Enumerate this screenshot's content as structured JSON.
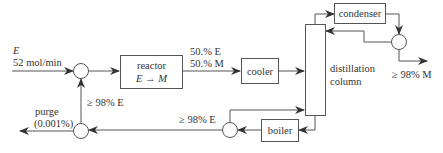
{
  "diagram": {
    "feed": {
      "species": "E",
      "rate": "52 mol/min"
    },
    "reactor": {
      "label": "reactor",
      "reaction": "E → M"
    },
    "reactor_outlet": {
      "line1": "50.% E",
      "line2": "50.% M"
    },
    "cooler": {
      "label": "cooler"
    },
    "column": {
      "line1": "distillation",
      "line2": "column"
    },
    "condenser": {
      "label": "condenser"
    },
    "product": {
      "label": "≥ 98% M"
    },
    "boiler": {
      "label": "boiler"
    },
    "bottoms": {
      "label": "≥ 98% E"
    },
    "recycle": {
      "label": "≥ 98% E"
    },
    "purge": {
      "line1": "purge",
      "line2": "(0.001%)"
    },
    "colors": {
      "line": "#555555",
      "text": "#333333",
      "background": "#ffffff"
    }
  }
}
